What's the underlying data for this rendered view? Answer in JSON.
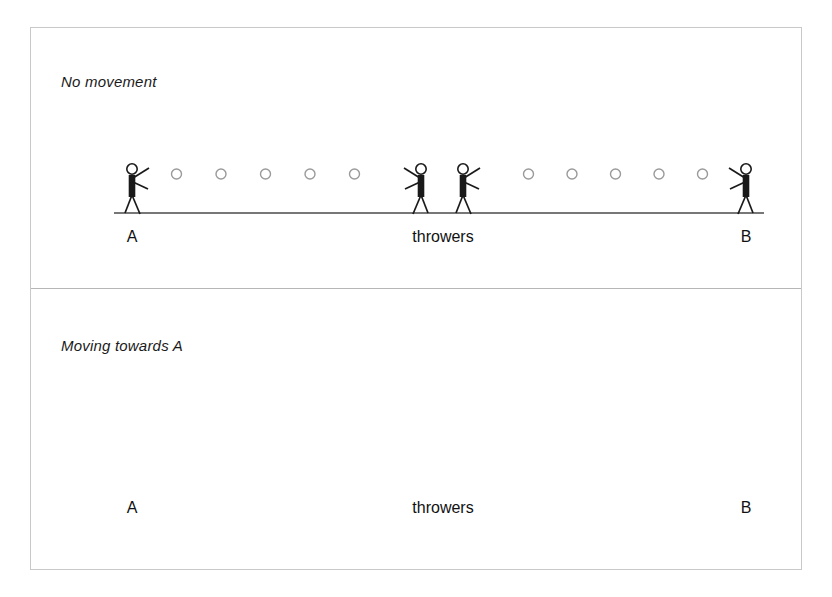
{
  "figure": {
    "stroke_color": "#1a1a1a",
    "frame_color": "#c9c9c9",
    "ball_outline_color": "#9a9a9a",
    "ground_color": "#4a4a4a"
  },
  "panels": [
    {
      "id": "no-movement",
      "caption": "No movement",
      "labels": {
        "left": "A",
        "center": "throwers",
        "right": "B"
      },
      "ground_y": 185,
      "ball_row_y": 146,
      "balls_left_segment": 5,
      "balls_right_segment": 5,
      "ball_radius": 5,
      "people": [
        {
          "name": "person-a",
          "x": 101,
          "facing": "right",
          "on_cart": false
        },
        {
          "name": "thrower-left",
          "x": 390,
          "facing": "left",
          "on_cart": false
        },
        {
          "name": "thrower-right",
          "x": 432,
          "facing": "right",
          "on_cart": false
        },
        {
          "name": "person-b",
          "x": 715,
          "facing": "left",
          "on_cart": false
        }
      ],
      "cart": null,
      "arrow": null
    },
    {
      "id": "moving-towards-a",
      "caption": "Moving towards A",
      "labels": {
        "left": "A",
        "center": "throwers",
        "right": "B"
      },
      "ground_y": 456,
      "ball_row_y": 417,
      "balls_left_segment": 5,
      "balls_right_segment": 5,
      "ball_radius": 5,
      "people": [
        {
          "name": "person-a",
          "x": 101,
          "facing": "right",
          "on_cart": false
        },
        {
          "name": "thrower-left",
          "x": 348,
          "facing": "left",
          "on_cart": true
        },
        {
          "name": "thrower-right",
          "x": 388,
          "facing": "right",
          "on_cart": true
        },
        {
          "name": "person-b",
          "x": 715,
          "facing": "left",
          "on_cart": false
        }
      ],
      "cart": {
        "deck_left": 330,
        "deck_right": 410,
        "deck_y": 441,
        "deck_thickness": 7,
        "wheel_radius": 9,
        "wheel_left_x": 345,
        "wheel_right_x": 393
      },
      "arrow": {
        "from_x": 330,
        "to_x": 252,
        "y": 440,
        "direction": "left",
        "thickness": 4,
        "head_length": 22,
        "head_width": 14
      }
    }
  ],
  "label_positions": {
    "left_x": 101,
    "center_x": 412,
    "right_x": 715,
    "top_label_y": 200,
    "bottom_label_y": 471
  }
}
